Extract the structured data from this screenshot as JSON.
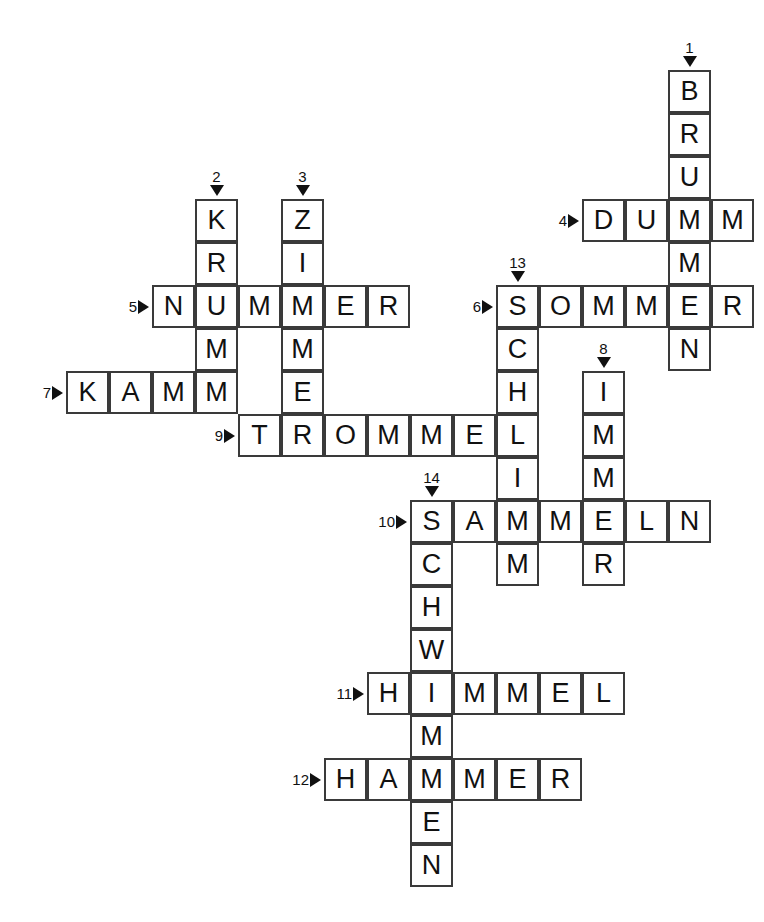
{
  "puzzle": {
    "title": "Kreuzwortraetsel",
    "grid": {
      "cell_size": 43,
      "origin_x": 66,
      "origin_y": 70,
      "columns": 15,
      "rows": 19,
      "border_color": "#3a3a3a",
      "cell_background": "#ffffff",
      "letter_color": "#111111",
      "page_background": "#ffffff"
    },
    "entries": [
      {
        "number": "1",
        "direction": "down",
        "answer": "BRUMMEN",
        "col": 14,
        "row": 0,
        "length": 7
      },
      {
        "number": "2",
        "direction": "down",
        "answer": "KRUMM",
        "col": 3,
        "row": 3,
        "length": 5
      },
      {
        "number": "3",
        "direction": "down",
        "answer": "ZIMMER",
        "col": 5,
        "row": 3,
        "length": 6
      },
      {
        "number": "4",
        "direction": "across",
        "answer": "DUMM",
        "col": 12,
        "row": 3,
        "length": 4
      },
      {
        "number": "5",
        "direction": "across",
        "answer": "NUMMER",
        "col": 2,
        "row": 5,
        "length": 6
      },
      {
        "number": "6",
        "direction": "across",
        "answer": "SOMMER",
        "col": 10,
        "row": 5,
        "length": 6
      },
      {
        "number": "7",
        "direction": "across",
        "answer": "KAMM",
        "col": 0,
        "row": 7,
        "length": 4
      },
      {
        "number": "8",
        "direction": "down",
        "answer": "IMMER",
        "col": 12,
        "row": 8,
        "length": 5
      },
      {
        "number": "9",
        "direction": "across",
        "answer": "TROMMEL",
        "col": 4,
        "row": 8,
        "length": 7
      },
      {
        "number": "10",
        "direction": "across",
        "answer": "SAMMELN",
        "col": 8,
        "row": 10,
        "length": 7
      },
      {
        "number": "11",
        "direction": "across",
        "answer": "HIMMEL",
        "col": 7,
        "row": 14,
        "length": 6
      },
      {
        "number": "12",
        "direction": "across",
        "answer": "HAMMER",
        "col": 6,
        "row": 16,
        "length": 6
      },
      {
        "number": "13",
        "direction": "down",
        "answer": "SCHLIMM",
        "col": 10,
        "row": 5,
        "length": 7
      },
      {
        "number": "14",
        "direction": "down",
        "answer": "SCHWIMMEN",
        "col": 8,
        "row": 10,
        "length": 9
      }
    ],
    "cells": [
      {
        "col": 14,
        "row": 0,
        "letter": "B"
      },
      {
        "col": 14,
        "row": 1,
        "letter": "R"
      },
      {
        "col": 14,
        "row": 2,
        "letter": "U"
      },
      {
        "col": 3,
        "row": 3,
        "letter": "K"
      },
      {
        "col": 5,
        "row": 3,
        "letter": "Z"
      },
      {
        "col": 12,
        "row": 3,
        "letter": "D"
      },
      {
        "col": 13,
        "row": 3,
        "letter": "U"
      },
      {
        "col": 14,
        "row": 3,
        "letter": "M"
      },
      {
        "col": 15,
        "row": 3,
        "letter": "M"
      },
      {
        "col": 3,
        "row": 4,
        "letter": "R"
      },
      {
        "col": 5,
        "row": 4,
        "letter": "I"
      },
      {
        "col": 14,
        "row": 4,
        "letter": "M"
      },
      {
        "col": 2,
        "row": 5,
        "letter": "N"
      },
      {
        "col": 3,
        "row": 5,
        "letter": "U"
      },
      {
        "col": 4,
        "row": 5,
        "letter": "M"
      },
      {
        "col": 5,
        "row": 5,
        "letter": "M"
      },
      {
        "col": 6,
        "row": 5,
        "letter": "E"
      },
      {
        "col": 7,
        "row": 5,
        "letter": "R"
      },
      {
        "col": 10,
        "row": 5,
        "letter": "S"
      },
      {
        "col": 11,
        "row": 5,
        "letter": "O"
      },
      {
        "col": 12,
        "row": 5,
        "letter": "M"
      },
      {
        "col": 13,
        "row": 5,
        "letter": "M"
      },
      {
        "col": 14,
        "row": 5,
        "letter": "E"
      },
      {
        "col": 15,
        "row": 5,
        "letter": "R"
      },
      {
        "col": 3,
        "row": 6,
        "letter": "M"
      },
      {
        "col": 5,
        "row": 6,
        "letter": "M"
      },
      {
        "col": 10,
        "row": 6,
        "letter": "C"
      },
      {
        "col": 14,
        "row": 6,
        "letter": "N"
      },
      {
        "col": 0,
        "row": 7,
        "letter": "K"
      },
      {
        "col": 1,
        "row": 7,
        "letter": "A"
      },
      {
        "col": 2,
        "row": 7,
        "letter": "M"
      },
      {
        "col": 3,
        "row": 7,
        "letter": "M"
      },
      {
        "col": 5,
        "row": 7,
        "letter": "E"
      },
      {
        "col": 10,
        "row": 7,
        "letter": "H"
      },
      {
        "col": 12,
        "row": 7,
        "letter": "I"
      },
      {
        "col": 4,
        "row": 8,
        "letter": "T"
      },
      {
        "col": 5,
        "row": 8,
        "letter": "R"
      },
      {
        "col": 6,
        "row": 8,
        "letter": "O"
      },
      {
        "col": 7,
        "row": 8,
        "letter": "M"
      },
      {
        "col": 8,
        "row": 8,
        "letter": "M"
      },
      {
        "col": 9,
        "row": 8,
        "letter": "E"
      },
      {
        "col": 10,
        "row": 8,
        "letter": "L"
      },
      {
        "col": 12,
        "row": 8,
        "letter": "M"
      },
      {
        "col": 10,
        "row": 9,
        "letter": "I"
      },
      {
        "col": 12,
        "row": 9,
        "letter": "M"
      },
      {
        "col": 8,
        "row": 10,
        "letter": "S"
      },
      {
        "col": 9,
        "row": 10,
        "letter": "A"
      },
      {
        "col": 10,
        "row": 10,
        "letter": "M"
      },
      {
        "col": 11,
        "row": 10,
        "letter": "M"
      },
      {
        "col": 12,
        "row": 10,
        "letter": "E"
      },
      {
        "col": 13,
        "row": 10,
        "letter": "L"
      },
      {
        "col": 14,
        "row": 10,
        "letter": "N"
      },
      {
        "col": 8,
        "row": 11,
        "letter": "C"
      },
      {
        "col": 10,
        "row": 11,
        "letter": "M"
      },
      {
        "col": 12,
        "row": 11,
        "letter": "R"
      },
      {
        "col": 8,
        "row": 12,
        "letter": "H"
      },
      {
        "col": 8,
        "row": 13,
        "letter": "W"
      },
      {
        "col": 7,
        "row": 14,
        "letter": "H"
      },
      {
        "col": 8,
        "row": 14,
        "letter": "I"
      },
      {
        "col": 9,
        "row": 14,
        "letter": "M"
      },
      {
        "col": 10,
        "row": 14,
        "letter": "M"
      },
      {
        "col": 11,
        "row": 14,
        "letter": "E"
      },
      {
        "col": 12,
        "row": 14,
        "letter": "L"
      },
      {
        "col": 8,
        "row": 15,
        "letter": "M"
      },
      {
        "col": 6,
        "row": 16,
        "letter": "H"
      },
      {
        "col": 7,
        "row": 16,
        "letter": "A"
      },
      {
        "col": 8,
        "row": 16,
        "letter": "M"
      },
      {
        "col": 9,
        "row": 16,
        "letter": "M"
      },
      {
        "col": 10,
        "row": 16,
        "letter": "E"
      },
      {
        "col": 11,
        "row": 16,
        "letter": "R"
      },
      {
        "col": 8,
        "row": 17,
        "letter": "E"
      },
      {
        "col": 8,
        "row": 18,
        "letter": "N"
      }
    ],
    "clue_markers": [
      {
        "number": "1",
        "direction": "down",
        "col": 14,
        "row": 0
      },
      {
        "number": "2",
        "direction": "down",
        "col": 3,
        "row": 3
      },
      {
        "number": "3",
        "direction": "down",
        "col": 5,
        "row": 3
      },
      {
        "number": "4",
        "direction": "across",
        "col": 12,
        "row": 3
      },
      {
        "number": "5",
        "direction": "across",
        "col": 2,
        "row": 5
      },
      {
        "number": "6",
        "direction": "across",
        "col": 10,
        "row": 5
      },
      {
        "number": "7",
        "direction": "across",
        "col": 0,
        "row": 7
      },
      {
        "number": "8",
        "direction": "down",
        "col": 12,
        "row": 7
      },
      {
        "number": "9",
        "direction": "across",
        "col": 4,
        "row": 8
      },
      {
        "number": "10",
        "direction": "across",
        "col": 8,
        "row": 10
      },
      {
        "number": "11",
        "direction": "across",
        "col": 7,
        "row": 14
      },
      {
        "number": "12",
        "direction": "across",
        "col": 6,
        "row": 16
      },
      {
        "number": "13",
        "direction": "down",
        "col": 10,
        "row": 5
      },
      {
        "number": "14",
        "direction": "down",
        "col": 8,
        "row": 10
      }
    ]
  }
}
